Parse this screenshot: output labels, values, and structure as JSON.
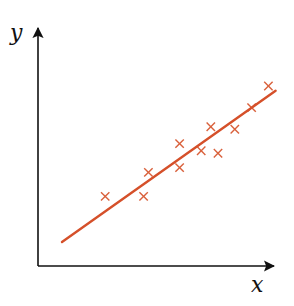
{
  "chart_data": {
    "type": "scatter",
    "title": "",
    "xlabel": "x",
    "ylabel": "y",
    "grid": false,
    "legend": null,
    "ticks": {
      "x": [],
      "y": []
    },
    "xlim": [
      0,
      10
    ],
    "ylim": [
      0,
      10
    ],
    "series": [
      {
        "name": "observations",
        "marker": "x",
        "color": "#d9603b",
        "points": [
          {
            "x": 2.8,
            "y": 2.9
          },
          {
            "x": 4.4,
            "y": 2.9
          },
          {
            "x": 4.6,
            "y": 3.9
          },
          {
            "x": 5.9,
            "y": 4.1
          },
          {
            "x": 5.9,
            "y": 5.1
          },
          {
            "x": 6.8,
            "y": 4.8
          },
          {
            "x": 7.5,
            "y": 4.7
          },
          {
            "x": 7.2,
            "y": 5.8
          },
          {
            "x": 8.2,
            "y": 5.7
          },
          {
            "x": 8.9,
            "y": 6.6
          },
          {
            "x": 9.6,
            "y": 7.5
          }
        ]
      },
      {
        "name": "regression line",
        "type": "line",
        "color": "#d5502a",
        "points": [
          {
            "x": 1.0,
            "y": 1.0
          },
          {
            "x": 9.9,
            "y": 7.3
          }
        ]
      }
    ],
    "axes_color": "#111111",
    "background": "#ffffff"
  },
  "labels": {
    "x_axis": "x",
    "y_axis": "y"
  }
}
